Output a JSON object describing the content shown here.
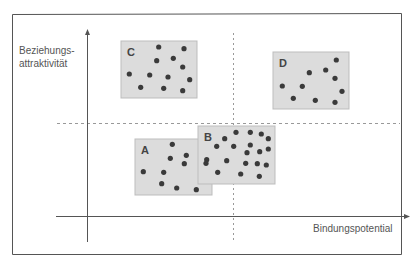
{
  "diagram": {
    "y_axis_label_lines": [
      "Beziehungs-",
      "attraktivität"
    ],
    "x_axis_label": "Bindungspotential",
    "colors": {
      "frame": "#555555",
      "axis": "#555555",
      "divider": "#888888",
      "box_fill": "#dcdcdc",
      "box_stroke": "#bdbdbd",
      "dot": "#3a3a3a",
      "text": "#555555"
    },
    "boxes": [
      {
        "label": "C",
        "x": 121,
        "y": 41,
        "w": 76,
        "h": 57,
        "dots": [
          [
            158.7,
            47
          ],
          [
            184,
            48.7
          ],
          [
            156.7,
            60.7
          ],
          [
            173.3,
            58.3
          ],
          [
            182.7,
            67
          ],
          [
            129.3,
            74
          ],
          [
            149.7,
            75
          ],
          [
            168,
            77
          ],
          [
            189.7,
            79.7
          ],
          [
            140.7,
            87.3
          ],
          [
            163.7,
            88.3
          ],
          [
            182.7,
            90.7
          ]
        ]
      },
      {
        "label": "D",
        "x": 273,
        "y": 52,
        "w": 76,
        "h": 57,
        "dots": [
          [
            336.3,
            60
          ],
          [
            309.3,
            72.7
          ],
          [
            325.7,
            70
          ],
          [
            335,
            78.3
          ],
          [
            282.3,
            86
          ],
          [
            302.3,
            86.3
          ],
          [
            342,
            91.3
          ],
          [
            293.3,
            98.3
          ],
          [
            315.3,
            100.3
          ],
          [
            335,
            102.3
          ]
        ]
      },
      {
        "label": "A",
        "x": 135,
        "y": 139,
        "w": 77,
        "h": 56,
        "dots": [
          [
            172.3,
            144.3
          ],
          [
            170.3,
            158.3
          ],
          [
            186.3,
            155.3
          ],
          [
            184.3,
            163.7
          ],
          [
            143.3,
            171.7
          ],
          [
            163.7,
            172.3
          ],
          [
            161.7,
            183.7
          ],
          [
            176.7,
            188
          ],
          [
            196.3,
            189.7
          ]
        ]
      },
      {
        "label": "B",
        "x": 198,
        "y": 126,
        "w": 77,
        "h": 58,
        "dots": [
          [
            236,
            132.3
          ],
          [
            250.3,
            132.3
          ],
          [
            261.3,
            134
          ],
          [
            268.3,
            138.7
          ],
          [
            224.7,
            138.7
          ],
          [
            216.7,
            146.3
          ],
          [
            233.7,
            146.3
          ],
          [
            250.3,
            145
          ],
          [
            247,
            152.7
          ],
          [
            259.7,
            151.7
          ],
          [
            268.3,
            149
          ],
          [
            206.7,
            159.7
          ],
          [
            226.7,
            160.7
          ],
          [
            245.7,
            163.3
          ],
          [
            257.3,
            163.7
          ],
          [
            266.3,
            165
          ],
          [
            217.7,
            172.3
          ],
          [
            240.7,
            174
          ],
          [
            259.3,
            176.3
          ],
          [
            206,
            163.3
          ]
        ]
      }
    ]
  }
}
